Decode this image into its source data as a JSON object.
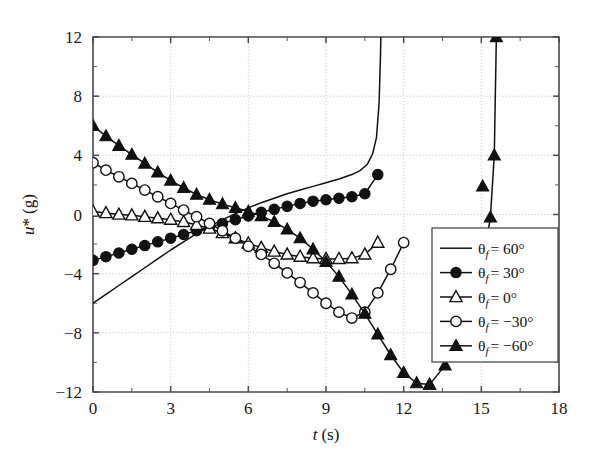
{
  "chart_data": {
    "type": "line",
    "title": "",
    "xlabel": "t (s)",
    "ylabel": "u* (g)",
    "xlim": [
      0,
      18
    ],
    "ylim": [
      -12,
      12
    ],
    "xticks": [
      0,
      3,
      6,
      9,
      12,
      15,
      18
    ],
    "xticklabels": [
      "0",
      "3",
      "6",
      "9",
      "12",
      "15",
      "18"
    ],
    "yticks": [
      -12,
      -8,
      -4,
      0,
      4,
      8,
      12
    ],
    "yticklabels": [
      "-12",
      "-8",
      "-4",
      "0",
      "4",
      "8",
      "12"
    ],
    "x_minor_ticks": [
      1.5,
      4.5,
      7.5,
      10.5,
      13.5,
      16.5
    ],
    "y_minor_ticks": [
      -10,
      -6,
      -2,
      2,
      6,
      10
    ],
    "grid": true,
    "grid_style": "dotted",
    "legend_position": "lower-right",
    "series": [
      {
        "name": "theta_f = 60 deg",
        "label": "θf = 60°",
        "marker": "none",
        "marker_fill": "none",
        "x": [
          0.0,
          0.5,
          1.0,
          1.5,
          2.0,
          2.5,
          3.0,
          3.5,
          4.0,
          4.5,
          5.0,
          5.5,
          6.0,
          6.5,
          7.0,
          7.5,
          8.0,
          8.5,
          9.0,
          9.5,
          10.0,
          10.3,
          10.6,
          10.8,
          10.95,
          11.05,
          11.1,
          11.12
        ],
        "y": [
          -6.0,
          -5.4,
          -4.8,
          -4.2,
          -3.6,
          -3.0,
          -2.4,
          -1.85,
          -1.3,
          -0.8,
          -0.35,
          0.05,
          0.45,
          0.8,
          1.1,
          1.4,
          1.65,
          1.9,
          2.15,
          2.4,
          2.7,
          2.95,
          3.4,
          4.1,
          5.2,
          7.5,
          10.5,
          12.0
        ]
      },
      {
        "name": "theta_f = 30 deg",
        "label": "θf = 30°",
        "marker": "circle",
        "marker_fill": "filled",
        "x": [
          0.0,
          0.5,
          1.0,
          1.5,
          2.0,
          2.5,
          3.0,
          3.5,
          4.0,
          4.5,
          5.0,
          5.5,
          6.0,
          6.5,
          7.0,
          7.5,
          8.0,
          8.5,
          9.0,
          9.5,
          10.0,
          10.5,
          11.0
        ],
        "y": [
          -3.1,
          -2.85,
          -2.6,
          -2.35,
          -2.1,
          -1.85,
          -1.6,
          -1.35,
          -1.1,
          -0.85,
          -0.6,
          -0.35,
          -0.1,
          0.15,
          0.35,
          0.55,
          0.75,
          0.9,
          1.0,
          1.1,
          1.2,
          1.4,
          2.7
        ]
      },
      {
        "name": "theta_f = 0 deg",
        "label": "θf = 0°",
        "marker": "triangle",
        "marker_fill": "open",
        "x": [
          0.0,
          0.5,
          1.0,
          1.5,
          2.0,
          2.5,
          3.0,
          3.5,
          4.0,
          4.5,
          5.0,
          5.5,
          6.0,
          6.5,
          7.0,
          7.5,
          8.0,
          8.5,
          9.0,
          9.5,
          10.0,
          10.5,
          11.0
        ],
        "y": [
          0.2,
          0.1,
          0.0,
          -0.05,
          -0.15,
          -0.25,
          -0.35,
          -0.5,
          -0.7,
          -0.95,
          -1.25,
          -1.6,
          -1.95,
          -2.25,
          -2.5,
          -2.7,
          -2.85,
          -2.95,
          -3.0,
          -3.0,
          -2.95,
          -2.7,
          -1.9
        ]
      },
      {
        "name": "theta_f = -30 deg",
        "label": "θf = -30°",
        "marker": "circle",
        "marker_fill": "open",
        "x": [
          0.0,
          0.5,
          1.0,
          1.5,
          2.0,
          2.5,
          3.0,
          3.5,
          4.0,
          4.5,
          5.0,
          5.5,
          6.0,
          6.5,
          7.0,
          7.5,
          8.0,
          8.5,
          9.0,
          9.5,
          10.0,
          10.5,
          11.0,
          11.5,
          12.0
        ],
        "y": [
          3.5,
          3.0,
          2.55,
          2.1,
          1.65,
          1.2,
          0.75,
          0.3,
          -0.15,
          -0.6,
          -1.1,
          -1.6,
          -2.15,
          -2.7,
          -3.3,
          -3.95,
          -4.6,
          -5.3,
          -6.0,
          -6.6,
          -7.0,
          -6.6,
          -5.3,
          -3.7,
          -1.9
        ]
      },
      {
        "name": "theta_f = -60 deg",
        "label": "θf = -60°",
        "marker": "triangle",
        "marker_fill": "filled",
        "x": [
          0.0,
          0.5,
          1.0,
          1.5,
          2.0,
          2.5,
          3.0,
          3.5,
          4.0,
          4.5,
          5.0,
          5.5,
          6.0,
          6.5,
          7.0,
          7.5,
          8.0,
          8.5,
          9.0,
          9.5,
          10.0,
          10.5,
          11.0,
          11.5,
          12.0,
          12.5,
          13.0
        ],
        "y": [
          6.0,
          5.3,
          4.65,
          4.05,
          3.45,
          2.85,
          2.3,
          1.8,
          1.35,
          1.0,
          0.7,
          0.45,
          0.2,
          -0.1,
          -0.5,
          -1.0,
          -1.6,
          -2.35,
          -3.2,
          -4.2,
          -5.4,
          -6.7,
          -8.1,
          -9.5,
          -10.7,
          -11.4,
          -11.5
        ]
      },
      {
        "name": "theta_f = -60 deg tail",
        "label": "",
        "marker": "triangle",
        "marker_fill": "filled",
        "x": [
          13.0,
          13.6,
          14.2,
          14.7,
          15.1,
          15.35,
          15.5,
          15.58
        ],
        "y": [
          -11.5,
          -10.2,
          -8.2,
          -5.8,
          -2.9,
          -0.2,
          4.0,
          12.0
        ]
      },
      {
        "name": "theta_f = -60 deg tail marker",
        "label": "",
        "marker": "triangle",
        "marker_fill": "filled",
        "x": [
          15.05
        ],
        "y": [
          1.9
        ]
      }
    ]
  },
  "legend": {
    "entries": [
      {
        "label": "θf = 60°",
        "symbol_prefix": "θ",
        "sub": "f",
        "value": "= 60°",
        "marker": "none"
      },
      {
        "label": "θf = 30°",
        "symbol_prefix": "θ",
        "sub": "f",
        "value": "= 30°",
        "marker": "filled-circle"
      },
      {
        "label": "θf = 0°",
        "symbol_prefix": "θ",
        "sub": "f",
        "value": "= 0°",
        "marker": "open-triangle"
      },
      {
        "label": "θf = −30°",
        "symbol_prefix": "θ",
        "sub": "f",
        "value": "= −30°",
        "marker": "open-circle"
      },
      {
        "label": "θf = −60°",
        "symbol_prefix": "θ",
        "sub": "f",
        "value": "= −60°",
        "marker": "filled-triangle"
      }
    ]
  },
  "axes": {
    "x_title_italic": "t",
    "x_title_unit": "(s)",
    "y_title_italic": "u",
    "y_title_star": "*",
    "y_title_unit": "(g)"
  },
  "colors": {
    "line": "#111111",
    "axis": "#4a4a4a",
    "grid": "#bdbdbd",
    "background": "#ffffff"
  }
}
